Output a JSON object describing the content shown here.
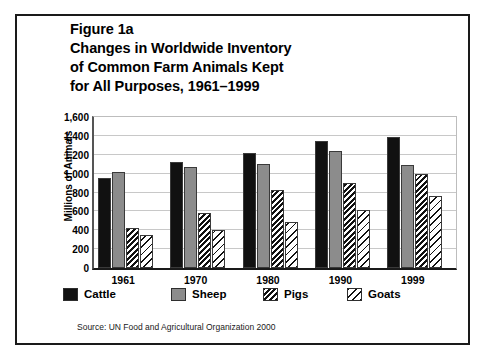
{
  "figure": {
    "title_lines": [
      "Figure 1a",
      "Changes in Worldwide Inventory",
      "of Common Farm Animals Kept",
      "for All Purposes, 1961–1999"
    ],
    "source": "Source: UN Food and Agricultural Organization 2000"
  },
  "chart_data": {
    "type": "bar",
    "title": "Figure 1a Changes in Worldwide Inventory of Common Farm Animals Kept for All Purposes, 1961–1999",
    "xlabel": "",
    "ylabel": "Millions of Animals",
    "categories": [
      "1961",
      "1970",
      "1980",
      "1990",
      "1999"
    ],
    "series": [
      {
        "name": "Cattle",
        "color": "#111111",
        "pattern": "solid-black",
        "values": [
          950,
          1120,
          1220,
          1350,
          1390
        ]
      },
      {
        "name": "Sheep",
        "color": "#8c8c8c",
        "pattern": "solid-gray",
        "values": [
          1020,
          1070,
          1100,
          1240,
          1090
        ]
      },
      {
        "name": "Pigs",
        "color": "#111111",
        "pattern": "dense-diagonal-hatch",
        "values": [
          420,
          580,
          830,
          900,
          1000
        ]
      },
      {
        "name": "Goats",
        "color": "#111111",
        "pattern": "sparse-diagonal-hatch",
        "values": [
          350,
          400,
          490,
          610,
          760
        ]
      }
    ],
    "ylim": [
      0,
      1600
    ],
    "yticks": [
      0,
      200,
      400,
      600,
      800,
      1000,
      1200,
      1400,
      1600
    ],
    "ytick_labels": [
      "0",
      "200",
      "400",
      "600",
      "800",
      "1,000",
      "1,200",
      "1,400",
      "1,600"
    ],
    "grid": true,
    "legend_position": "bottom"
  }
}
